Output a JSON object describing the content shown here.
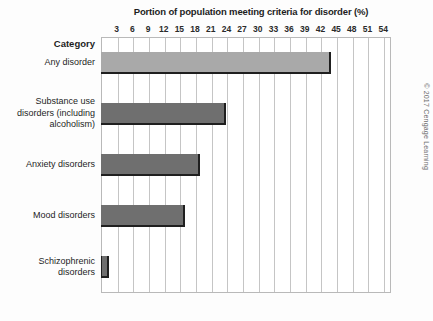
{
  "chart_data": {
    "type": "bar",
    "orientation": "horizontal",
    "title": "Portion of population meeting criteria for disorder (%)",
    "xlabel": "",
    "ylabel": "Category",
    "categories": [
      "Any disorder",
      "Substance use disorders (including alcoholism)",
      "Anxiety disorders",
      "Mood disorders",
      "Schizophrenic disorders"
    ],
    "values": [
      44,
      24,
      19,
      16,
      1.5
    ],
    "xlim": [
      0,
      55.5
    ],
    "xticks": [
      3,
      6,
      9,
      12,
      15,
      18,
      21,
      24,
      27,
      30,
      33,
      36,
      39,
      42,
      45,
      48,
      51,
      54
    ],
    "xtick_labels": [
      "3",
      "6",
      "9",
      "12",
      "15",
      "18",
      "21",
      "24",
      "27",
      "30",
      "33",
      "36",
      "39",
      "42",
      "45",
      "48",
      "51",
      "54"
    ],
    "grid": true,
    "grid_axis": "x",
    "legend": false,
    "bar_colors": [
      "#a9a9a9",
      "#6f6f6f",
      "#6f6f6f",
      "#6f6f6f",
      "#6f6f6f"
    ],
    "bar_edge_color": "#1f1f1f"
  },
  "category_header": "Category",
  "credit": "© 2017 Cengage Learning",
  "colors": {
    "bar_light": "#a9a9a9",
    "bar_dark": "#6f6f6f",
    "grid": "#c5c5c5",
    "frame": "#b9b9b9",
    "text": "#1d1d1d"
  }
}
